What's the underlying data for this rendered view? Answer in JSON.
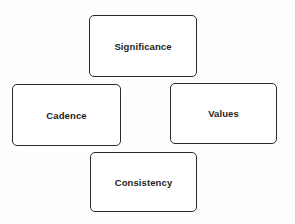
{
  "diagram": {
    "nodes": [
      {
        "id": "significance",
        "label": "Significance",
        "position": "top"
      },
      {
        "id": "cadence",
        "label": "Cadence",
        "position": "left"
      },
      {
        "id": "values",
        "label": "Values",
        "position": "right"
      },
      {
        "id": "consistency",
        "label": "Consistency",
        "position": "bottom"
      }
    ],
    "colors": {
      "border": "#2a2a2a",
      "text": "#1e1e1e",
      "background": "#ffffff"
    }
  }
}
